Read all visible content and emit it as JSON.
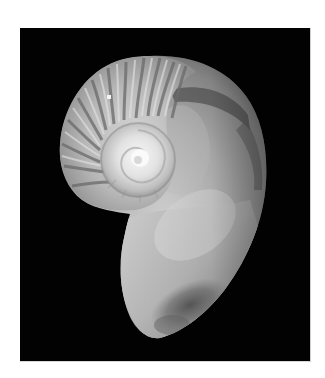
{
  "image": {
    "subject": "Nautilus shell",
    "description": "Grayscale, low-resolution photograph of a chambered nautilus shell on a black background",
    "colors": {
      "page_background": "#ffffff",
      "photo_background": "#020202",
      "shell_highlight": "#f2f2f2",
      "shell_mid": "#b5b5b5",
      "shell_shadow": "#6e6e6e",
      "shell_dark": "#3a3a3a"
    }
  }
}
